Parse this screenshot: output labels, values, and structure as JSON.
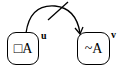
{
  "diagram": {
    "nodes": [
      {
        "id": "u",
        "content": "□A",
        "label": "u"
      },
      {
        "id": "v",
        "content": "~A",
        "label": "v"
      }
    ],
    "edges": [
      {
        "from": "u",
        "to": "v",
        "type": "curved-arrow",
        "crossed": true
      }
    ]
  }
}
